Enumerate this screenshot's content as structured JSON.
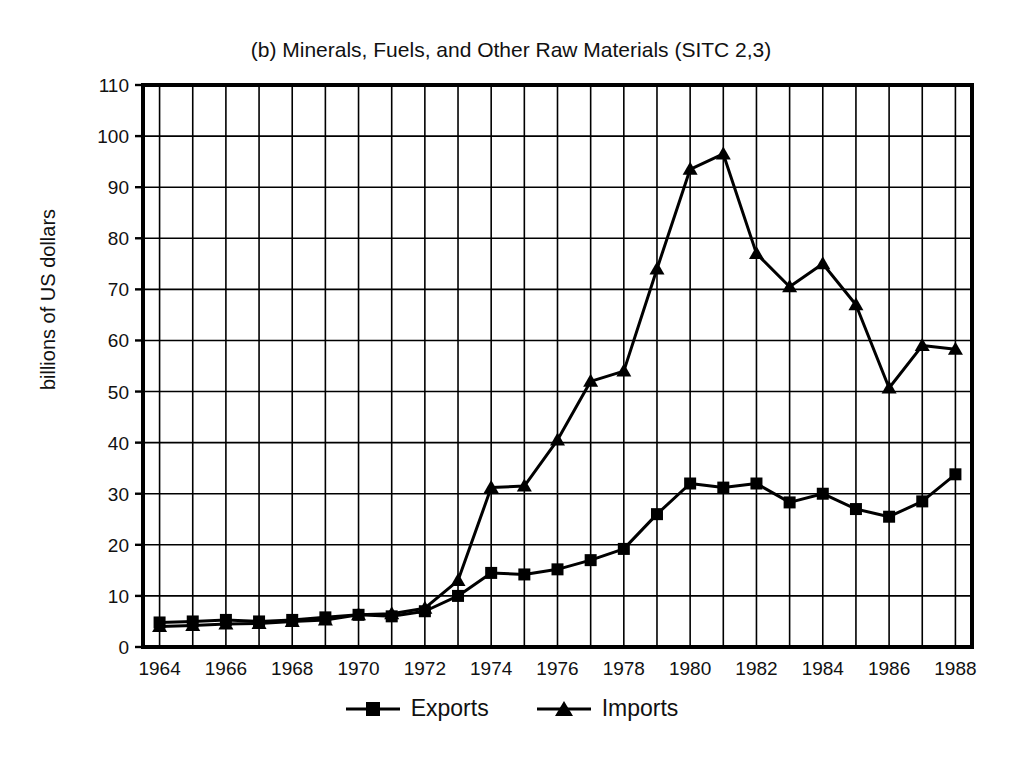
{
  "chart_data": {
    "type": "line",
    "title": "(b) Minerals, Fuels, and Other Raw Materials (SITC 2,3)",
    "xlabel": "",
    "ylabel": "billions of US dollars",
    "ylim": [
      0,
      110
    ],
    "ytick_step": 10,
    "xlim": [
      1963.5,
      1988.5
    ],
    "grid": true,
    "legend_position": "bottom-center",
    "x": [
      1964,
      1965,
      1966,
      1967,
      1968,
      1969,
      1970,
      1971,
      1972,
      1973,
      1974,
      1975,
      1976,
      1977,
      1978,
      1979,
      1980,
      1981,
      1982,
      1983,
      1984,
      1985,
      1986,
      1987,
      1988
    ],
    "xticks": [
      "1964",
      "1966",
      "1968",
      "1970",
      "1972",
      "1974",
      "1976",
      "1978",
      "1980",
      "1982",
      "1984",
      "1986",
      "1988"
    ],
    "yticks": [
      "0",
      "10",
      "20",
      "30",
      "40",
      "50",
      "60",
      "70",
      "80",
      "90",
      "100",
      "110"
    ],
    "series": [
      {
        "name": "Exports",
        "marker": "square",
        "color": "#000000",
        "values": [
          4.8,
          5.0,
          5.3,
          5.0,
          5.3,
          5.8,
          6.3,
          6.0,
          7.0,
          10.0,
          14.5,
          14.2,
          15.2,
          17.0,
          19.2,
          26.0,
          32.0,
          31.2,
          32.0,
          28.3,
          30.0,
          27.0,
          25.5,
          28.5,
          33.8
        ]
      },
      {
        "name": "Imports",
        "marker": "triangle",
        "color": "#000000",
        "values": [
          4.0,
          4.2,
          4.5,
          4.6,
          5.0,
          5.3,
          6.3,
          6.5,
          7.6,
          13.0,
          31.2,
          31.5,
          40.5,
          52.0,
          54.0,
          74.0,
          93.5,
          96.5,
          77.0,
          70.5,
          75.0,
          67.0,
          50.7,
          59.0,
          58.3
        ]
      }
    ]
  },
  "legend": {
    "entries": [
      {
        "label": "Exports",
        "marker": "square-marker-icon"
      },
      {
        "label": "Imports",
        "marker": "triangle-marker-icon"
      }
    ]
  },
  "colors": {
    "ink": "#000000",
    "background": "#ffffff",
    "grid": "#000000"
  }
}
